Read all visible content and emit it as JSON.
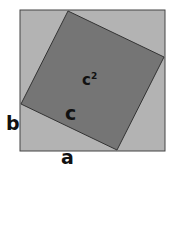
{
  "diagram": {
    "colors": {
      "outer_fill": "#b3b3b3",
      "inner_fill": "#757575",
      "stroke": "#333333",
      "text": "#111111"
    },
    "labels": {
      "area": "c",
      "area_exp": "2",
      "hyp": "c",
      "side_b": "b",
      "side_a": "a"
    }
  }
}
